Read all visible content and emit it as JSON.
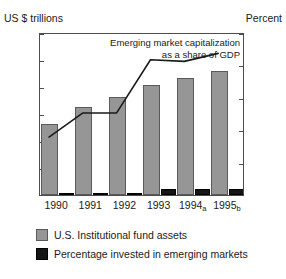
{
  "chart_data": {
    "type": "bar",
    "title": "",
    "subtitle": "",
    "annotation": {
      "line1": "Emerging market capitalization",
      "line2": "as a share of GDP"
    },
    "categories": [
      "1990",
      "1991",
      "1992",
      "1993",
      "1994",
      "1995"
    ],
    "category_labels": [
      {
        "year": "1990",
        "note": ""
      },
      {
        "year": "1991",
        "note": ""
      },
      {
        "year": "1992",
        "note": ""
      },
      {
        "year": "1993",
        "note": ""
      },
      {
        "year": "1994",
        "note": "a"
      },
      {
        "year": "1995",
        "note": "b"
      }
    ],
    "ylabel": "US $ trillions",
    "ylabel_secondary": "Percent",
    "xlabel": "",
    "ylim": [
      0,
      12
    ],
    "ylim_secondary": [
      0,
      50
    ],
    "yticks": [
      0,
      2,
      4,
      6,
      8,
      10,
      12
    ],
    "yticks_secondary": [
      0,
      10,
      20,
      30,
      40,
      50
    ],
    "grid": false,
    "legend_position": "below",
    "series": [
      {
        "name": "U.S. Institutional fund assets",
        "type": "bar",
        "axis": "left",
        "units": "US $ trillions",
        "color": "#969696",
        "values": [
          5.2,
          6.5,
          7.25,
          8.1,
          8.6,
          9.1
        ]
      },
      {
        "name": "Percentage invested in emerging markets",
        "type": "bar",
        "axis": "right",
        "units": "Percent",
        "color": "#151515",
        "values": [
          0.2,
          0.3,
          0.3,
          1.8,
          1.9,
          1.9
        ]
      },
      {
        "name": "Emerging market capitalization as a share of GDP",
        "type": "line",
        "axis": "right",
        "units": "Percent",
        "color": "#1a1a1a",
        "values": [
          18,
          25.5,
          25.5,
          42,
          41.5,
          44
        ]
      }
    ]
  },
  "legend": {
    "items": [
      {
        "label": "U.S. Institutional fund assets",
        "swatch": "gray"
      },
      {
        "label": "Percentage invested in emerging markets",
        "swatch": "black"
      }
    ]
  }
}
